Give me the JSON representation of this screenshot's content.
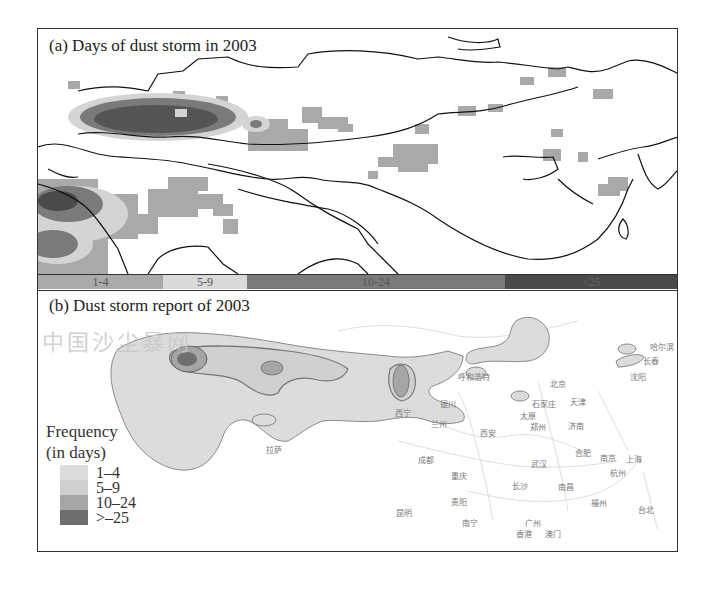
{
  "figure": {
    "panel_a": {
      "title": "(a) Days of dust storm in 2003",
      "colorbar": [
        {
          "label": "1-4",
          "color": "#a9a9a9",
          "width_px": 125
        },
        {
          "label": "5-9",
          "color": "#d9d9d9",
          "width_px": 84
        },
        {
          "label": "10-24",
          "color": "#7a7a7a",
          "width_px": 258
        },
        {
          "label": ">25",
          "color": "#4a4a4a",
          "width_px": 174
        }
      ]
    },
    "panel_b": {
      "title": "(b) Dust storm report of 2003",
      "watermark": "中国沙尘暴网",
      "legend": {
        "title_line1": "Frequency",
        "title_line2": "(in days)",
        "items": [
          {
            "label": "1–4",
            "color": "#dcdcdc"
          },
          {
            "label": "5–9",
            "color": "#cfcfcf"
          },
          {
            "label": "10–24",
            "color": "#a5a5a5"
          },
          {
            "label": ">–25",
            "color": "#6e6e6e"
          }
        ]
      },
      "cities": [
        {
          "name": "呼和浩特",
          "x": 420,
          "y": 80
        },
        {
          "name": "北京",
          "x": 512,
          "y": 87
        },
        {
          "name": "天津",
          "x": 532,
          "y": 105
        },
        {
          "name": "石家庄",
          "x": 494,
          "y": 107
        },
        {
          "name": "太原",
          "x": 482,
          "y": 119
        },
        {
          "name": "济南",
          "x": 530,
          "y": 129
        },
        {
          "name": "郑州",
          "x": 492,
          "y": 130
        },
        {
          "name": "西安",
          "x": 442,
          "y": 136
        },
        {
          "name": "银川",
          "x": 402,
          "y": 107
        },
        {
          "name": "兰州",
          "x": 393,
          "y": 127
        },
        {
          "name": "西宁",
          "x": 357,
          "y": 116
        },
        {
          "name": "拉萨",
          "x": 228,
          "y": 153
        },
        {
          "name": "成都",
          "x": 380,
          "y": 163
        },
        {
          "name": "重庆",
          "x": 413,
          "y": 179
        },
        {
          "name": "武汉",
          "x": 493,
          "y": 167
        },
        {
          "name": "合肥",
          "x": 537,
          "y": 156
        },
        {
          "name": "南京",
          "x": 562,
          "y": 161
        },
        {
          "name": "上海",
          "x": 588,
          "y": 162
        },
        {
          "name": "杭州",
          "x": 572,
          "y": 176
        },
        {
          "name": "长沙",
          "x": 474,
          "y": 189
        },
        {
          "name": "南昌",
          "x": 520,
          "y": 190
        },
        {
          "name": "福州",
          "x": 553,
          "y": 206
        },
        {
          "name": "台北",
          "x": 600,
          "y": 213
        },
        {
          "name": "贵阳",
          "x": 413,
          "y": 205
        },
        {
          "name": "昆明",
          "x": 358,
          "y": 216
        },
        {
          "name": "南宁",
          "x": 424,
          "y": 226
        },
        {
          "name": "广州",
          "x": 487,
          "y": 226
        },
        {
          "name": "香港",
          "x": 478,
          "y": 237
        },
        {
          "name": "澳门",
          "x": 507,
          "y": 237
        },
        {
          "name": "沈阳",
          "x": 592,
          "y": 80
        },
        {
          "name": "长春",
          "x": 605,
          "y": 64
        },
        {
          "name": "哈尔滨",
          "x": 612,
          "y": 50
        }
      ]
    }
  }
}
